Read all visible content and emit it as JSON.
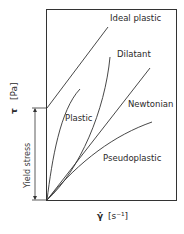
{
  "diagram": {
    "y_axis": {
      "symbol": "τ",
      "unit": "[Pa]"
    },
    "x_axis": {
      "symbol": "γ̇",
      "unit": "[s⁻¹]"
    },
    "yield_stress_label": "Yield stress",
    "curves": [
      {
        "id": "ideal-plastic",
        "label": "Ideal plastic"
      },
      {
        "id": "dilatant",
        "label": "Dilatant"
      },
      {
        "id": "newtonian",
        "label": "Newtonian"
      },
      {
        "id": "plastic",
        "label": "Plastic"
      },
      {
        "id": "pseudoplastic",
        "label": "Pseudoplastic"
      }
    ]
  }
}
